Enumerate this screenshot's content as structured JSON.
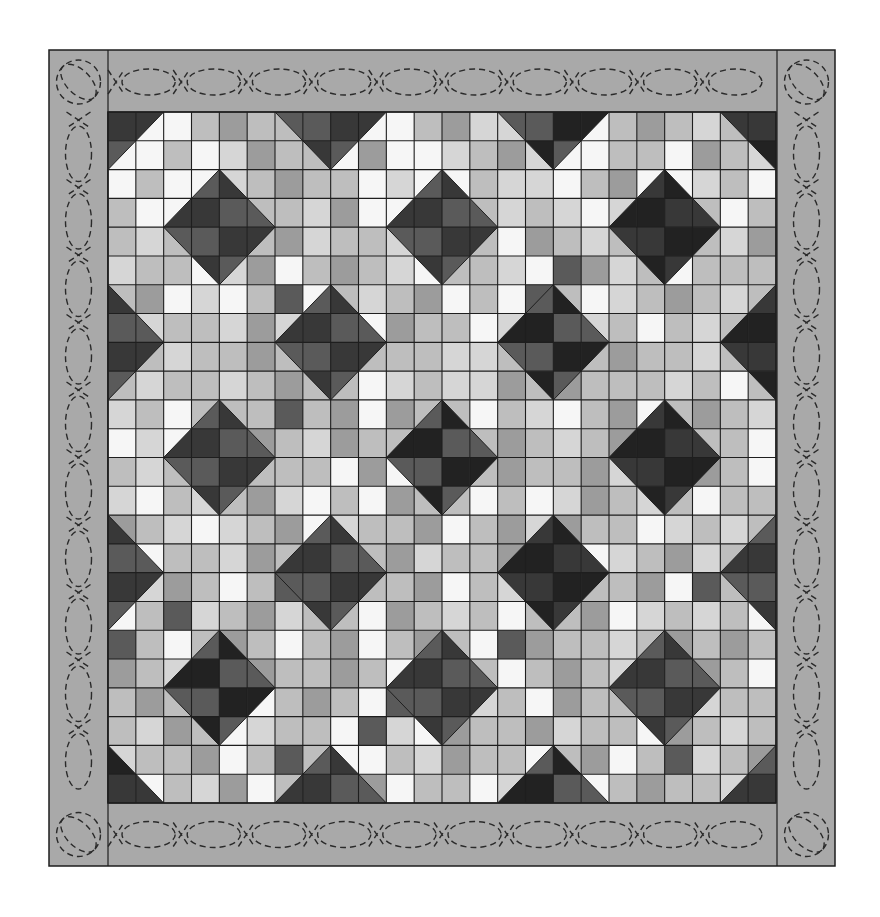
{
  "title": "Star quilt layout diagram",
  "quilt": {
    "outer": {
      "x": 49,
      "y": 50,
      "w": 786,
      "h": 816
    },
    "grid": {
      "x": 108,
      "y": 112,
      "w": 668,
      "h": 691,
      "cols": 24,
      "rows": 24
    },
    "colors": {
      "border_fill": "#a9a9a9",
      "outline": "#1e1e1e",
      "quilting": "#2a2a2a",
      "tones": {
        "W": "#f6f6f6",
        "V": "#d6d6d6",
        "L": "#bebebe",
        "M": "#9c9c9c",
        "D": "#5a5a5a",
        "K": "#383838",
        "X": "#222222"
      }
    },
    "background_rows": [
      "VWWLMLLLMWWLMVVLWWLMLVLL",
      "WWLWVMLLWMWWVLMVWWLLWMLV",
      "WLWWVLMLLWVWWLVVWLMWWVLW",
      "LWWLLLLVMWWMLLVLVWVLWLWL",
      "LVLLWLMVLLVMLLWMLVLWLLVM",
      "VLLWVMWLMLVWLLVWDMVLWLLL",
      "LMWVWLDWLVLMWLWDLWVLMLVL",
      "WVLLVMVWLWMLLWVLMVLWLVLW",
      "LLVLLMLVMLLLVVLWLLMLLVLL",
      "LVLLVLMLLWVLVVMLMLLLVLWL",
      "VLWLLLDLMWMLLWLVWLMWLMLV",
      "WVWVLMLVMLLMWLMLVLMVWLLW",
      "LVLMVLLLWMWLWLMLLMVWLMLW",
      "VWLVLMVWLWMLLWLWVMLVLWLL",
      "MLVWVLMWVLLMWLMVMLLWVLVL",
      "LWLLVMLLWLMVLLMLMWVLMVLL",
      "LVMLWLDLMLLMWLVLMLLMWDLV",
      "WLDVLMVLLWMLVLWLLMWVLVLW",
      "DLWLMLWLMWLMLWDMLLVLMLML",
      "MLVLWMLLMLWVLLWLMLVWLMLW",
      "LMLVLWLMLWDLMVLWMLLMWVLL",
      "LVMLWVLLWDVWMLLMVLLWMLVL",
      "VLLMWLDLWWLVMLLWLMWLDVLM",
      "LWLVMWLDLMWLLWVMLWLMLLVL"
    ],
    "stars": [
      {
        "c": 0,
        "r": 0,
        "a": "K",
        "b": "D"
      },
      {
        "c": 8,
        "r": 0,
        "a": "K",
        "b": "D"
      },
      {
        "c": 16,
        "r": 0,
        "a": "X",
        "b": "D"
      },
      {
        "c": 24,
        "r": 0,
        "a": "X",
        "b": "K"
      },
      {
        "c": 4,
        "r": 4,
        "a": "K",
        "b": "D"
      },
      {
        "c": 12,
        "r": 4,
        "a": "K",
        "b": "D"
      },
      {
        "c": 20,
        "r": 4,
        "a": "X",
        "b": "K"
      },
      {
        "c": 0,
        "r": 8,
        "a": "K",
        "b": "D"
      },
      {
        "c": 8,
        "r": 8,
        "a": "K",
        "b": "D"
      },
      {
        "c": 16,
        "r": 8,
        "a": "X",
        "b": "D"
      },
      {
        "c": 24,
        "r": 8,
        "a": "X",
        "b": "K"
      },
      {
        "c": 4,
        "r": 12,
        "a": "K",
        "b": "D"
      },
      {
        "c": 12,
        "r": 12,
        "a": "X",
        "b": "D"
      },
      {
        "c": 20,
        "r": 12,
        "a": "X",
        "b": "K"
      },
      {
        "c": 0,
        "r": 16,
        "a": "K",
        "b": "D"
      },
      {
        "c": 8,
        "r": 16,
        "a": "K",
        "b": "D"
      },
      {
        "c": 16,
        "r": 16,
        "a": "X",
        "b": "K"
      },
      {
        "c": 24,
        "r": 16,
        "a": "K",
        "b": "D"
      },
      {
        "c": 4,
        "r": 20,
        "a": "X",
        "b": "D"
      },
      {
        "c": 12,
        "r": 20,
        "a": "K",
        "b": "D"
      },
      {
        "c": 20,
        "r": 20,
        "a": "K",
        "b": "D"
      },
      {
        "c": 0,
        "r": 24,
        "a": "X",
        "b": "K"
      },
      {
        "c": 8,
        "r": 24,
        "a": "K",
        "b": "D"
      },
      {
        "c": 16,
        "r": 24,
        "a": "X",
        "b": "D"
      },
      {
        "c": 24,
        "r": 24,
        "a": "K",
        "b": "D"
      }
    ],
    "border_quilting": {
      "pattern": "dashed-cable",
      "ellipse_len": 66,
      "ellipse_thick": 30
    }
  }
}
